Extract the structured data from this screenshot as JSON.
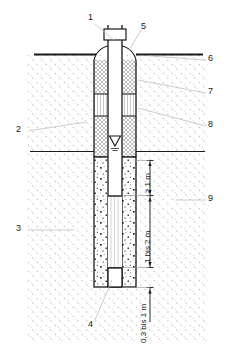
{
  "diagram": {
    "type": "groundwater-monitoring-well-cross-section",
    "colors": {
      "line": "#1a1a1a",
      "leader": "#b9b9b9",
      "soil_stipple": "#c9c9c9",
      "hatch": "#6e6e6e",
      "background": "#ffffff"
    }
  },
  "callouts": {
    "left": [
      {
        "id": "2",
        "label": "2"
      },
      {
        "id": "3",
        "label": "3"
      }
    ],
    "right": [
      {
        "id": "6",
        "label": "6"
      },
      {
        "id": "7",
        "label": "7"
      },
      {
        "id": "8",
        "label": "8"
      },
      {
        "id": "9",
        "label": "9"
      }
    ],
    "top": [
      {
        "id": "1",
        "label": "1"
      },
      {
        "id": "5",
        "label": "5"
      }
    ],
    "bottom": [
      {
        "id": "4",
        "label": "4"
      }
    ]
  },
  "dimensions": [
    {
      "id": "dim-above-screen",
      "label": "≥ 1 m"
    },
    {
      "id": "dim-screen-length",
      "label": "1 bis 2 m"
    },
    {
      "id": "dim-sump",
      "label": "0,3 bis 1 m"
    }
  ],
  "symbols": {
    "groundwater_table": "water-table-triangle"
  }
}
